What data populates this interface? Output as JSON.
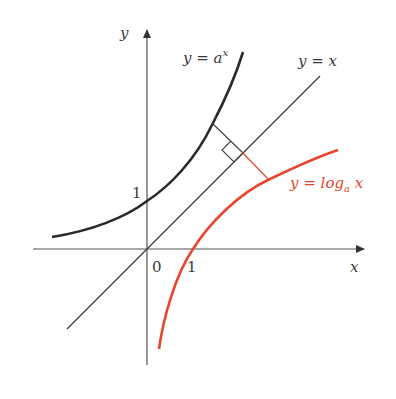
{
  "diagram": {
    "axes": {
      "x_label": "x",
      "y_label": "y",
      "origin_label": "0",
      "x_tick_label": "1",
      "y_tick_label": "1"
    },
    "curves": [
      {
        "id": "exp",
        "label_prefix": "y = a",
        "label_sup": "x",
        "color": "#2a2a2a"
      },
      {
        "id": "identity",
        "label": "y = x",
        "color": "#3a3a3a"
      },
      {
        "id": "log",
        "label_prefix": "y = log",
        "label_sub": "a",
        "label_suffix": " x",
        "color": "#e8452f"
      }
    ],
    "annotation": "perpendicular segment with right-angle marker showing reflection across y = x",
    "colors": {
      "axis": "#444444",
      "exp": "#2a2a2a",
      "log": "#e8452f",
      "identity": "#3a3a3a"
    }
  }
}
